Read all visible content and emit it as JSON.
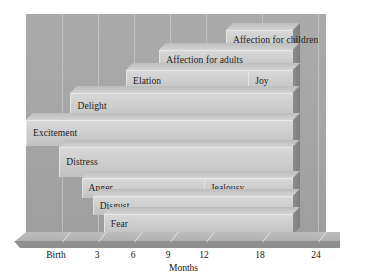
{
  "chart_data": {
    "type": "bar",
    "title": "",
    "subtitle": "",
    "xlabel": "Months",
    "ylabel": "",
    "orientation": "horizontal",
    "style": "3d-stepped-range-bars",
    "grid": "vertical-light",
    "legend": "none",
    "xlim": [
      0,
      27
    ],
    "tick_labels": [
      "Birth",
      "3",
      "6",
      "9",
      "12",
      "18",
      "24"
    ],
    "tick_values": [
      0,
      3,
      6,
      9,
      12,
      18,
      24
    ],
    "colors": {
      "background": "#a8a8a8",
      "bar_face": "#cfcfcf",
      "bar_top": "#c6c6c6",
      "bar_side": "#848484",
      "gridline": "#c5c5c5",
      "text": "#141414"
    },
    "categories": [
      "Affection for children",
      "Affection for adults",
      "Elation",
      "Joy",
      "Delight",
      "Excitement",
      "Distress",
      "Anger",
      "Jealousy",
      "Disgust",
      "Fear"
    ],
    "bars": [
      {
        "label": "Affection for children",
        "start_month": 18,
        "end_month": 24,
        "row": 0,
        "label_align": "left"
      },
      {
        "label": "Affection for adults",
        "start_month": 12,
        "end_month": 24,
        "row": 1,
        "label_align": "left"
      },
      {
        "label": "Elation",
        "start_month": 9,
        "end_month": 24,
        "row": 2,
        "label_align": "left"
      },
      {
        "label": "Joy",
        "start_month": 20,
        "end_month": 24,
        "row": 2,
        "label_align": "left"
      },
      {
        "label": "Delight",
        "start_month": 4,
        "end_month": 24,
        "row": 3,
        "label_align": "left"
      },
      {
        "label": "Excitement",
        "start_month": 0,
        "end_month": 24,
        "row": 4,
        "label_align": "left"
      },
      {
        "label": "Distress",
        "start_month": 3,
        "end_month": 24,
        "row": 5,
        "label_align": "left"
      },
      {
        "label": "Anger",
        "start_month": 5,
        "end_month": 24,
        "row": 6,
        "label_align": "left"
      },
      {
        "label": "Jealousy",
        "start_month": 16,
        "end_month": 24,
        "row": 6,
        "label_align": "left"
      },
      {
        "label": "Disgust",
        "start_month": 6,
        "end_month": 24,
        "row": 7,
        "label_align": "left"
      },
      {
        "label": "Fear",
        "start_month": 7,
        "end_month": 24,
        "row": 8,
        "label_align": "left"
      }
    ]
  },
  "axis": {
    "title": "Months",
    "ticks": [
      {
        "label": "Birth",
        "x": 56
      },
      {
        "label": "3",
        "x": 97
      },
      {
        "label": "6",
        "x": 133
      },
      {
        "label": "9",
        "x": 168
      },
      {
        "label": "12",
        "x": 204
      },
      {
        "label": "18",
        "x": 260
      },
      {
        "label": "24",
        "x": 316
      }
    ]
  },
  "layout": {
    "gridlines_x": [
      62,
      98,
      134,
      170,
      206,
      262,
      318
    ],
    "bar_rows": [
      {
        "top": 30,
        "height": 19
      },
      {
        "top": 50,
        "height": 19
      },
      {
        "top": 70,
        "height": 22
      },
      {
        "top": 93,
        "height": 26
      },
      {
        "top": 120,
        "height": 26
      },
      {
        "top": 147,
        "height": 30
      },
      {
        "top": 178,
        "height": 20
      },
      {
        "top": 196,
        "height": 19
      },
      {
        "top": 214,
        "height": 20
      }
    ]
  }
}
